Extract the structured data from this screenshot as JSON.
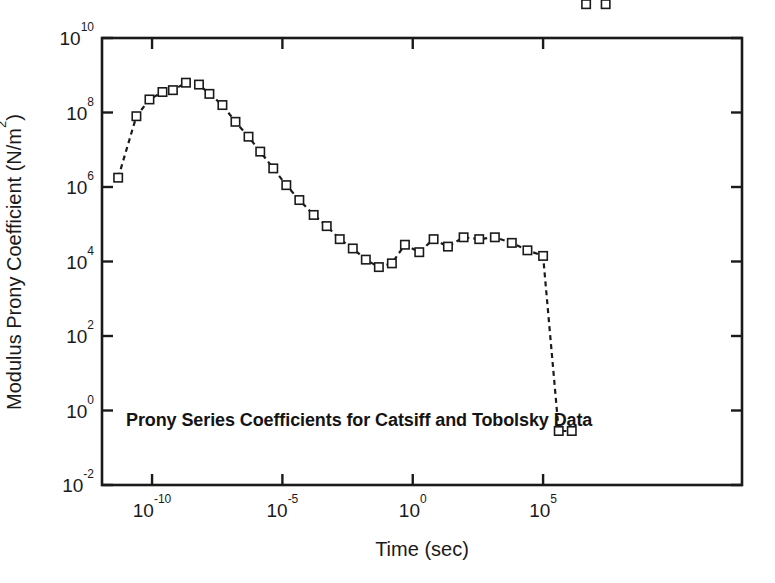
{
  "chart_data": {
    "type": "line",
    "title": "",
    "annotation": "Prony Series Coefficients for Catsiff and Tobolsky Data",
    "xlabel": "Time (sec)",
    "ylabel_text": "Modulus Prony Coefficient (N/m",
    "ylabel_sup": "2",
    "ylabel_tail": ")",
    "ylabel_full": "Modulus Prony Coefficient (N/m2)",
    "xscale": "log",
    "yscale": "log",
    "xlim_log10": [
      -11.92,
      12.63
    ],
    "ylim_log10": [
      -2,
      10
    ],
    "grid": false,
    "legend": false,
    "marker": "open-square",
    "linestyle": "dashed",
    "line_color": "#1a1a1a",
    "marker_face_color": "#ffffff",
    "marker_edge_color": "#1a1a1a",
    "xticks_log10": [
      -10,
      -5,
      0,
      5
    ],
    "xtick_labels": [
      "10-10",
      "10-5",
      "100",
      "105"
    ],
    "xtick_mantissa": [
      "10",
      "10",
      "10",
      "10"
    ],
    "xtick_exponents": [
      "-10",
      "-5",
      "0",
      "5"
    ],
    "yticks_log10": [
      10,
      8,
      6,
      4,
      2,
      0,
      -2
    ],
    "ytick_mantissa": [
      "10",
      "10",
      "10",
      "10",
      "10",
      "10",
      "10"
    ],
    "ytick_exponents": [
      "10",
      "8",
      "6",
      "4",
      "2",
      "0",
      "-2"
    ],
    "series": [
      {
        "name": "Prony coefficients",
        "x_log10": [
          -11.3,
          -10.6,
          -10.1,
          -9.6,
          -9.2,
          -8.7,
          -8.2,
          -7.8,
          -7.3,
          -6.8,
          -6.3,
          -5.85,
          -5.35,
          -4.85,
          -4.35,
          -3.8,
          -3.3,
          -2.8,
          -2.3,
          -1.8,
          -1.3,
          -0.8,
          -0.3,
          0.25,
          0.8,
          1.35,
          1.95,
          2.55,
          3.15,
          3.8,
          4.4,
          5.0,
          5.6,
          6.1,
          6.65,
          7.4
        ],
        "y_log10": [
          6.25,
          7.9,
          8.35,
          8.55,
          8.6,
          8.8,
          8.75,
          8.5,
          8.2,
          7.75,
          7.35,
          6.95,
          6.5,
          6.05,
          5.65,
          5.25,
          4.95,
          4.6,
          4.35,
          4.05,
          3.85,
          3.95,
          4.45,
          4.25,
          4.6,
          4.4,
          4.65,
          4.6,
          4.65,
          4.5,
          4.3,
          4.15,
          -0.55,
          -0.55
        ],
        "n_points": 36
      }
    ]
  },
  "figure": {
    "background": "#ffffff",
    "frame_color": "#1a1a1a"
  }
}
